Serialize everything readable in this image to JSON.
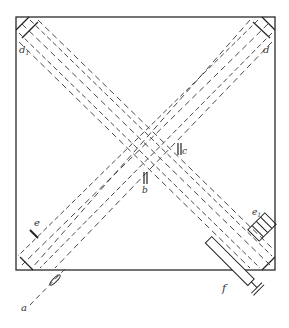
{
  "diagram": {
    "type": "interferometer schematic",
    "frame": {
      "x": 16,
      "y": 17,
      "width": 259,
      "height": 253
    },
    "ink_color": "#2a2a2a",
    "labels": {
      "d1": "d",
      "d1_sub": "1",
      "d": "d",
      "c": "c",
      "b": "b",
      "e": "e",
      "e1": "e",
      "e1_sub": "1",
      "a": "a",
      "f": "f"
    }
  }
}
